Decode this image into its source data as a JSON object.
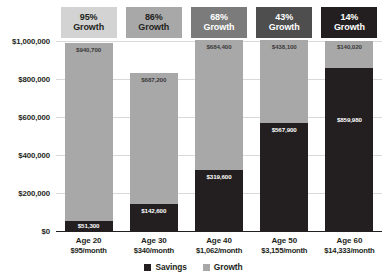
{
  "chart_data": {
    "type": "bar",
    "subtype": "stacked-bar",
    "title": "",
    "xlabel": "",
    "ylabel": "",
    "ylim": [
      0,
      1000000
    ],
    "yticks": [
      0,
      200000,
      400000,
      600000,
      800000,
      1000000
    ],
    "ytick_labels": [
      "$0",
      "$200,000",
      "$400,000",
      "$600,000",
      "$800,000",
      "$1,000,000"
    ],
    "grid": true,
    "legend_position": "bottom",
    "categories": [
      "Age 20",
      "Age 30",
      "Age 40",
      "Age 50",
      "Age 60"
    ],
    "series": [
      {
        "name": "Savings",
        "values": [
          51300,
          142600,
          319600,
          567900,
          859980
        ],
        "value_labels": [
          "$51,300",
          "$142,600",
          "$319,600",
          "$567,900",
          "$859,980"
        ]
      },
      {
        "name": "Growth",
        "values": [
          940700,
          687200,
          684400,
          438100,
          140020
        ],
        "value_labels": [
          "$940,700",
          "$687,200",
          "$684,400",
          "$438,100",
          "$140,020"
        ]
      }
    ],
    "annotations": {
      "growth_badges": [
        "95% Growth",
        "86% Growth",
        "68% Growth",
        "43% Growth",
        "14% Growth"
      ],
      "monthly_contributions": [
        "$95/month",
        "$340/month",
        "$1,062/month",
        "$3,155/month",
        "$14,333/month"
      ]
    },
    "colors": {
      "savings": "#231f20",
      "growth": "#a8a8a8",
      "gridline": "#d8d9db",
      "axis": "#231f20",
      "background": "#ffffff"
    }
  },
  "badges": [
    {
      "percent": "95%",
      "word": "Growth",
      "bg": "#d3d3d3",
      "fg": "#231f20"
    },
    {
      "percent": "86%",
      "word": "Growth",
      "bg": "#a8a8a8",
      "fg": "#231f20"
    },
    {
      "percent": "68%",
      "word": "Growth",
      "bg": "#7b7b7b",
      "fg": "#ffffff"
    },
    {
      "percent": "43%",
      "word": "Growth",
      "bg": "#4e4e4e",
      "fg": "#ffffff"
    },
    {
      "percent": "14%",
      "word": "Growth",
      "bg": "#231f20",
      "fg": "#ffffff"
    }
  ],
  "yaxis": {
    "ticks": [
      {
        "label": "$1,000,000",
        "value": 1000000
      },
      {
        "label": "$800,000",
        "value": 800000
      },
      {
        "label": "$600,000",
        "value": 600000
      },
      {
        "label": "$400,000",
        "value": 400000
      },
      {
        "label": "$200,000",
        "value": 200000
      },
      {
        "label": "$0",
        "value": 0
      }
    ]
  },
  "bars": [
    {
      "age": "Age 20",
      "contribution": "$95/month",
      "growth_value": 940700,
      "growth_label": "$940,700",
      "savings_value": 51300,
      "savings_label": "$51,300"
    },
    {
      "age": "Age 30",
      "contribution": "$340/month",
      "growth_value": 687200,
      "growth_label": "$687,200",
      "savings_value": 142600,
      "savings_label": "$142,600"
    },
    {
      "age": "Age 40",
      "contribution": "$1,062/month",
      "growth_value": 684400,
      "growth_label": "$684,400",
      "savings_value": 319600,
      "savings_label": "$319,600"
    },
    {
      "age": "Age 50",
      "contribution": "$3,155/month",
      "growth_value": 438100,
      "growth_label": "$438,100",
      "savings_value": 567900,
      "savings_label": "$567,900"
    },
    {
      "age": "Age 60",
      "contribution": "$14,333/month",
      "growth_value": 140020,
      "growth_label": "$140,020",
      "savings_value": 859980,
      "savings_label": "$859,980"
    }
  ],
  "legend": [
    {
      "label": "Savings",
      "color": "#231f20"
    },
    {
      "label": "Growth",
      "color": "#a8a8a8"
    }
  ]
}
